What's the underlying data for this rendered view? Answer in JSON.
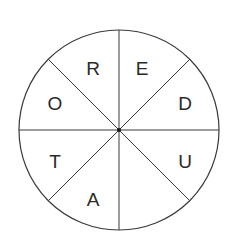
{
  "diagram": {
    "type": "letter-wheel",
    "segments_count": 8,
    "segments": [
      {
        "position": "top-right",
        "letter": "E"
      },
      {
        "position": "right-upper",
        "letter": "D"
      },
      {
        "position": "right-lower",
        "letter": "U"
      },
      {
        "position": "bottom-right",
        "letter": ""
      },
      {
        "position": "bottom-left",
        "letter": "A"
      },
      {
        "position": "left-lower",
        "letter": "T"
      },
      {
        "position": "left-upper",
        "letter": "O"
      },
      {
        "position": "top-left",
        "letter": "R"
      }
    ],
    "colors": {
      "line": "#3a3a3a",
      "text": "#2a2a2a",
      "background": "#ffffff"
    }
  }
}
